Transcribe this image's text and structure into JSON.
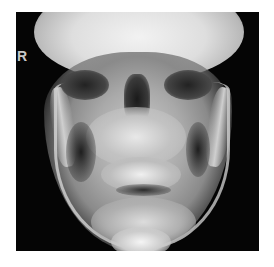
{
  "image": {
    "subject": "frontal skull radiograph",
    "side_marker": "R",
    "colors": {
      "background": "#ffffff",
      "film_dark": "#050505",
      "bone_bright": "#f2f2f2",
      "marker": "#c8c8c8"
    }
  }
}
